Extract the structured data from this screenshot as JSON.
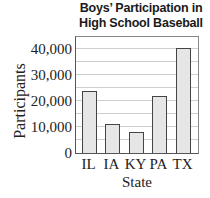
{
  "chart_data": {
    "type": "bar",
    "title_lines": [
      "Boys’ Participation in",
      "High School Baseball"
    ],
    "xlabel": "State",
    "ylabel": "Participants",
    "categories": [
      "IL",
      "IA",
      "KY",
      "PA",
      "TX"
    ],
    "values": [
      24000,
      11000,
      8000,
      22000,
      40500
    ],
    "ylim": [
      0,
      45000
    ],
    "yticks": [
      0,
      10000,
      20000,
      30000,
      40000
    ],
    "ytick_labels": [
      "0",
      "10,000",
      "20,000",
      "30,000",
      "40,000"
    ],
    "grid": true,
    "grid_interval": 5000,
    "bar_color": "#e6e6e6",
    "bar_edge_color": "#444444",
    "legend": null
  }
}
